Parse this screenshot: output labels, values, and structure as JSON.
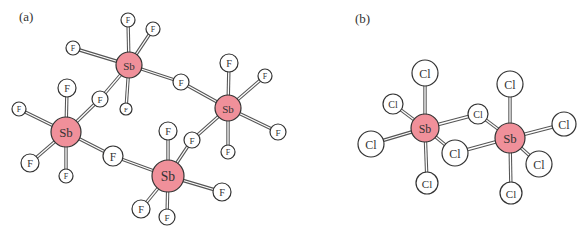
{
  "panels": [
    {
      "label": "(a)",
      "label_pos": [
        19,
        21
      ],
      "description": "Tetrameric (SbF5)4 ring structure with bridging fluorines",
      "colors": {
        "sb_fill": "#f0909a",
        "halogen_fill": "#ffffff",
        "outline": "#333333"
      },
      "atoms": [
        {
          "id": "sb1",
          "element": "Sb",
          "x": 129,
          "y": 65,
          "r": 13
        },
        {
          "id": "sb2",
          "element": "Sb",
          "x": 228,
          "y": 108,
          "r": 13
        },
        {
          "id": "sb3",
          "element": "Sb",
          "x": 66,
          "y": 132,
          "r": 15
        },
        {
          "id": "sb4",
          "element": "Sb",
          "x": 168,
          "y": 176,
          "r": 16
        },
        {
          "id": "f1a",
          "element": "F",
          "x": 128,
          "y": 20,
          "r": 7
        },
        {
          "id": "f1b",
          "element": "F",
          "x": 153,
          "y": 29,
          "r": 7
        },
        {
          "id": "f1c",
          "element": "F",
          "x": 73,
          "y": 48,
          "r": 7
        },
        {
          "id": "f1d",
          "element": "F",
          "x": 126,
          "y": 109,
          "r": 6
        },
        {
          "id": "fb12",
          "element": "F",
          "x": 181,
          "y": 82,
          "r": 8
        },
        {
          "id": "fb13",
          "element": "F",
          "x": 100,
          "y": 99,
          "r": 8
        },
        {
          "id": "f2a",
          "element": "F",
          "x": 229,
          "y": 63,
          "r": 9
        },
        {
          "id": "f2b",
          "element": "F",
          "x": 265,
          "y": 76,
          "r": 7
        },
        {
          "id": "f2c",
          "element": "F",
          "x": 278,
          "y": 132,
          "r": 8
        },
        {
          "id": "f2d",
          "element": "F",
          "x": 228,
          "y": 152,
          "r": 7
        },
        {
          "id": "fb24",
          "element": "F",
          "x": 192,
          "y": 140,
          "r": 8
        },
        {
          "id": "f3a",
          "element": "F",
          "x": 67,
          "y": 88,
          "r": 9
        },
        {
          "id": "f3b",
          "element": "F",
          "x": 19,
          "y": 109,
          "r": 7
        },
        {
          "id": "f3c",
          "element": "F",
          "x": 30,
          "y": 163,
          "r": 9
        },
        {
          "id": "f3d",
          "element": "F",
          "x": 66,
          "y": 176,
          "r": 7
        },
        {
          "id": "fb34",
          "element": "F",
          "x": 113,
          "y": 156,
          "r": 10
        },
        {
          "id": "f4a",
          "element": "F",
          "x": 168,
          "y": 131,
          "r": 9
        },
        {
          "id": "f4b",
          "element": "F",
          "x": 222,
          "y": 192,
          "r": 9
        },
        {
          "id": "f4c",
          "element": "F",
          "x": 141,
          "y": 209,
          "r": 9
        },
        {
          "id": "f4d",
          "element": "F",
          "x": 167,
          "y": 217,
          "r": 8
        }
      ],
      "bonds": [
        [
          "sb1",
          "f1a"
        ],
        [
          "sb1",
          "f1b"
        ],
        [
          "sb1",
          "f1c"
        ],
        [
          "sb1",
          "f1d"
        ],
        [
          "sb1",
          "fb12"
        ],
        [
          "sb1",
          "fb13"
        ],
        [
          "sb2",
          "f2a"
        ],
        [
          "sb2",
          "f2b"
        ],
        [
          "sb2",
          "f2c"
        ],
        [
          "sb2",
          "f2d"
        ],
        [
          "sb2",
          "fb12"
        ],
        [
          "sb2",
          "fb24"
        ],
        [
          "sb3",
          "f3a"
        ],
        [
          "sb3",
          "f3b"
        ],
        [
          "sb3",
          "f3c"
        ],
        [
          "sb3",
          "f3d"
        ],
        [
          "sb3",
          "fb13"
        ],
        [
          "sb3",
          "fb34"
        ],
        [
          "sb4",
          "f4a"
        ],
        [
          "sb4",
          "f4b"
        ],
        [
          "sb4",
          "f4c"
        ],
        [
          "sb4",
          "f4d"
        ],
        [
          "sb4",
          "fb34"
        ],
        [
          "sb4",
          "fb24"
        ]
      ]
    },
    {
      "label": "(b)",
      "label_pos": [
        355,
        23
      ],
      "description": "Dimeric Sb2Cl10 with two bridging chlorines",
      "colors": {
        "sb_fill": "#f0909a",
        "halogen_fill": "#ffffff",
        "outline": "#333333"
      },
      "atoms": [
        {
          "id": "sbL",
          "element": "Sb",
          "x": 425,
          "y": 128,
          "r": 14
        },
        {
          "id": "sbR",
          "element": "Sb",
          "x": 510,
          "y": 138,
          "r": 15
        },
        {
          "id": "clL1",
          "element": "Cl",
          "x": 425,
          "y": 73,
          "r": 13
        },
        {
          "id": "clL2",
          "element": "Cl",
          "x": 393,
          "y": 104,
          "r": 10
        },
        {
          "id": "clL3",
          "element": "Cl",
          "x": 371,
          "y": 144,
          "r": 13
        },
        {
          "id": "clL4",
          "element": "Cl",
          "x": 427,
          "y": 183,
          "r": 11
        },
        {
          "id": "clb1",
          "element": "Cl",
          "x": 478,
          "y": 114,
          "r": 10
        },
        {
          "id": "clb2",
          "element": "Cl",
          "x": 455,
          "y": 153,
          "r": 13
        },
        {
          "id": "clR1",
          "element": "Cl",
          "x": 510,
          "y": 84,
          "r": 13
        },
        {
          "id": "clR2",
          "element": "Cl",
          "x": 564,
          "y": 124,
          "r": 12
        },
        {
          "id": "clR3",
          "element": "Cl",
          "x": 539,
          "y": 164,
          "r": 13
        },
        {
          "id": "clR4",
          "element": "Cl",
          "x": 511,
          "y": 193,
          "r": 11
        }
      ],
      "bonds": [
        [
          "sbL",
          "clL1"
        ],
        [
          "sbL",
          "clL2"
        ],
        [
          "sbL",
          "clL3"
        ],
        [
          "sbL",
          "clL4"
        ],
        [
          "sbL",
          "clb1"
        ],
        [
          "sbL",
          "clb2"
        ],
        [
          "sbR",
          "clR1"
        ],
        [
          "sbR",
          "clR2"
        ],
        [
          "sbR",
          "clR3"
        ],
        [
          "sbR",
          "clR4"
        ],
        [
          "sbR",
          "clb1"
        ],
        [
          "sbR",
          "clb2"
        ]
      ]
    }
  ]
}
